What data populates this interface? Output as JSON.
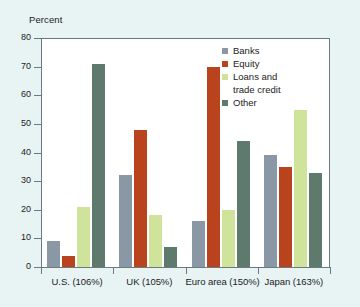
{
  "chart_data": {
    "type": "bar",
    "title": "",
    "subtitle": "",
    "xlabel": "",
    "ylabel": "Percent",
    "ylim": [
      0,
      80
    ],
    "yticks": [
      0,
      10,
      20,
      30,
      40,
      50,
      60,
      70,
      80
    ],
    "ytick_labels": [
      "0",
      "10",
      "20",
      "30",
      "40",
      "50",
      "60",
      "70",
      "80"
    ],
    "grid": false,
    "legend_position": "top-right",
    "categories": [
      "U.S. (106%)",
      "UK (105%)",
      "Euro area (150%)",
      "Japan (163%)"
    ],
    "series": [
      {
        "name": "Banks",
        "color": "#8a98a6",
        "values": [
          9,
          32,
          16,
          39
        ]
      },
      {
        "name": "Equity",
        "color": "#b8431d",
        "values": [
          4,
          48,
          70,
          35
        ]
      },
      {
        "name": "Loans and trade credit",
        "color": "#cfe39a",
        "values": [
          21,
          18,
          20,
          55
        ]
      },
      {
        "name": "Other",
        "color": "#5d7a6d",
        "values": [
          71,
          7,
          44,
          33
        ]
      }
    ],
    "legend": [
      {
        "label": "Banks",
        "label2": "",
        "color": "#8a98a6"
      },
      {
        "label": "Equity",
        "label2": "",
        "color": "#b8431d"
      },
      {
        "label": "Loans and",
        "label2": "trade credit",
        "color": "#cfe39a"
      },
      {
        "label": "Other",
        "label2": "",
        "color": "#5d7a6d"
      }
    ]
  },
  "colors": {
    "background": "#e8f3f3",
    "plot_background": "#ffffff",
    "axis": "#6b7a80",
    "text": "#1b1b1b",
    "banks": "#8a98a6",
    "equity": "#b8431d",
    "loans": "#cfe39a",
    "other": "#5d7a6d"
  }
}
